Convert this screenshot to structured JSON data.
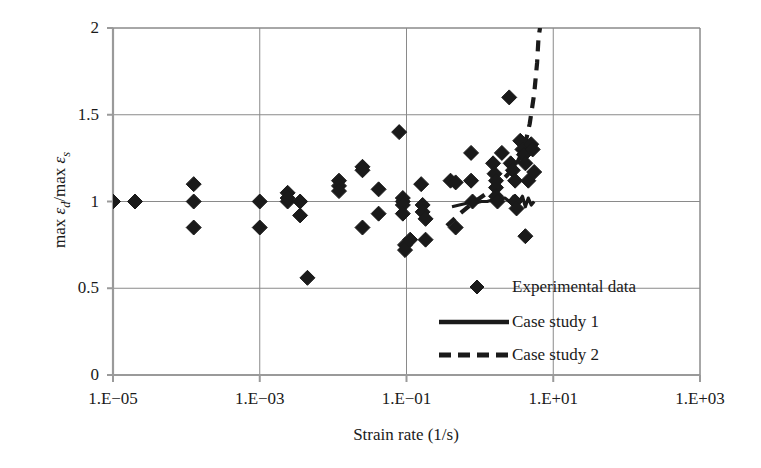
{
  "chart_data": {
    "type": "scatter",
    "title": "",
    "xlabel": "Strain rate (1/s)",
    "ylabel": "max εd/max εs",
    "ylabel_parts": {
      "prefix": "max ",
      "eps1": "ε",
      "sub1": "d",
      "mid": "/max ",
      "eps2": "ε",
      "sub2": "s"
    },
    "x_scale": "log10",
    "xlim": [
      -5,
      3
    ],
    "ylim": [
      0,
      2
    ],
    "grid": true,
    "x_tick_labels": [
      "1.E−05",
      "1.E−03",
      "1.E−01",
      "1.E+01",
      "1.E+03"
    ],
    "x_tick_exponents": [
      -5,
      -3,
      -1,
      1,
      3
    ],
    "y_tick_labels": [
      "0",
      "0.5",
      "1",
      "1.5",
      "2"
    ],
    "y_tick_values": [
      0,
      0.5,
      1,
      1.5,
      2
    ],
    "legend_position": "inside-lower-right",
    "legend": [
      {
        "label": "Experimental data",
        "marker": "diamond",
        "style": "none"
      },
      {
        "label": "Case study 1",
        "marker": "none",
        "style": "solid"
      },
      {
        "label": "Case study 2",
        "marker": "none",
        "style": "dashed"
      }
    ],
    "series": [
      {
        "name": "Experimental data",
        "marker": "diamond",
        "color": "#1a1a1a",
        "points": [
          [
            -5.0,
            1.0
          ],
          [
            -4.7,
            1.0
          ],
          [
            -3.9,
            1.1
          ],
          [
            -3.9,
            1.0
          ],
          [
            -3.9,
            0.85
          ],
          [
            -3.0,
            1.0
          ],
          [
            -3.0,
            0.85
          ],
          [
            -2.62,
            1.05
          ],
          [
            -2.62,
            1.0
          ],
          [
            -2.62,
            1.02
          ],
          [
            -2.45,
            1.0
          ],
          [
            -2.45,
            0.92
          ],
          [
            -2.35,
            0.56
          ],
          [
            -1.92,
            1.12
          ],
          [
            -1.92,
            1.09
          ],
          [
            -1.92,
            1.06
          ],
          [
            -1.6,
            1.2
          ],
          [
            -1.6,
            1.18
          ],
          [
            -1.6,
            0.85
          ],
          [
            -1.38,
            1.07
          ],
          [
            -1.38,
            0.93
          ],
          [
            -1.1,
            1.4
          ],
          [
            -1.05,
            1.02
          ],
          [
            -1.05,
            1.0
          ],
          [
            -1.05,
            0.98
          ],
          [
            -1.05,
            0.93
          ],
          [
            -1.02,
            0.75
          ],
          [
            -1.02,
            0.72
          ],
          [
            -0.95,
            0.78
          ],
          [
            -0.8,
            1.1
          ],
          [
            -0.78,
            0.98
          ],
          [
            -0.78,
            0.94
          ],
          [
            -0.74,
            0.9
          ],
          [
            -0.74,
            0.78
          ],
          [
            -0.4,
            1.12
          ],
          [
            -0.33,
            1.11
          ],
          [
            -0.33,
            0.85
          ],
          [
            -0.12,
            1.28
          ],
          [
            -0.12,
            1.12
          ],
          [
            -0.1,
            1.0
          ],
          [
            0.18,
            1.22
          ],
          [
            0.2,
            1.16
          ],
          [
            0.22,
            1.12
          ],
          [
            0.22,
            1.08
          ],
          [
            0.22,
            1.03
          ],
          [
            0.24,
            1.0
          ],
          [
            0.3,
            1.28
          ],
          [
            0.4,
            1.6
          ],
          [
            0.42,
            1.22
          ],
          [
            0.45,
            1.18
          ],
          [
            0.48,
            1.12
          ],
          [
            0.48,
            1.0
          ],
          [
            0.5,
            0.96
          ],
          [
            0.55,
            1.35
          ],
          [
            0.58,
            1.3
          ],
          [
            0.6,
            1.27
          ],
          [
            0.62,
            1.22
          ],
          [
            0.66,
            1.12
          ],
          [
            0.7,
            1.33
          ],
          [
            0.72,
            1.3
          ],
          [
            0.74,
            1.17
          ],
          [
            0.62,
            0.8
          ]
        ]
      },
      {
        "name": "Case study 1",
        "style": "solid",
        "color": "#1a1a1a",
        "points": [
          [
            -0.38,
            0.97
          ],
          [
            -0.28,
            0.98
          ],
          [
            -0.18,
            0.99
          ],
          [
            -0.08,
            0.99
          ],
          [
            0.02,
            1.0
          ],
          [
            0.1,
            1.0
          ],
          [
            0.18,
            1.01
          ],
          [
            0.26,
            1.01
          ],
          [
            0.34,
            1.02
          ],
          [
            0.4,
            1.0
          ],
          [
            0.46,
            1.03
          ],
          [
            0.52,
            0.99
          ],
          [
            0.58,
            1.03
          ],
          [
            0.62,
            0.97
          ],
          [
            0.66,
            1.02
          ],
          [
            0.7,
            0.98
          ],
          [
            0.74,
            1.0
          ]
        ]
      },
      {
        "name": "Case study 2",
        "style": "dashed",
        "color": "#1a1a1a",
        "points": [
          [
            -0.45,
            0.86
          ],
          [
            -0.3,
            0.92
          ],
          [
            -0.1,
            0.99
          ],
          [
            0.1,
            1.05
          ],
          [
            0.3,
            1.12
          ],
          [
            0.48,
            1.2
          ],
          [
            0.6,
            1.3
          ],
          [
            0.68,
            1.45
          ],
          [
            0.74,
            1.62
          ],
          [
            0.78,
            1.8
          ],
          [
            0.8,
            1.95
          ],
          [
            0.82,
            2.0
          ]
        ]
      }
    ]
  }
}
